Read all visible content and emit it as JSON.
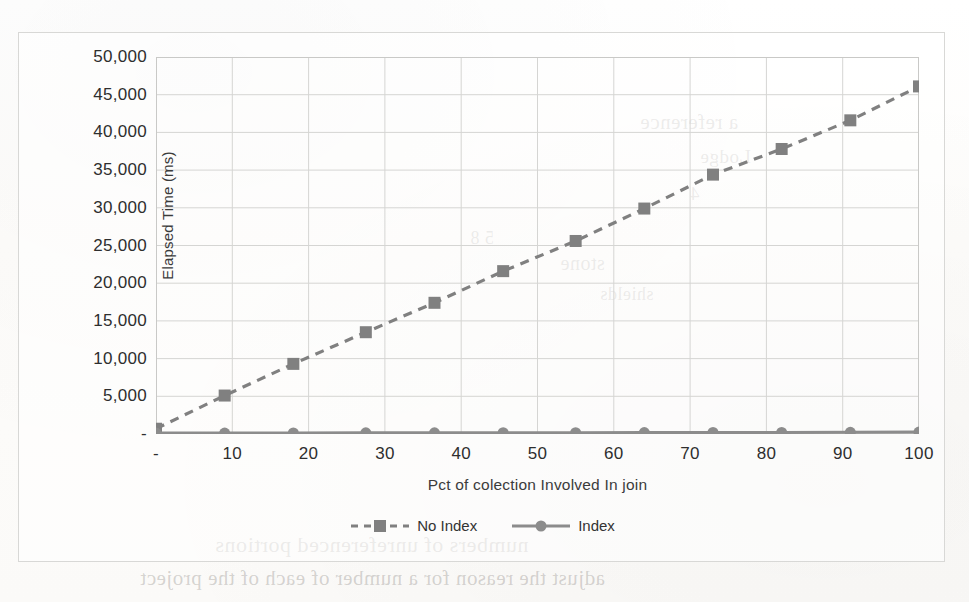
{
  "chart_data": {
    "type": "line",
    "title": "",
    "xlabel": "Pct of colection Involved In join",
    "ylabel": "Elapsed Time (ms)",
    "x": [
      0,
      9,
      18,
      27.5,
      36.5,
      45.5,
      55,
      64,
      73,
      82,
      91,
      100
    ],
    "xlim": [
      0,
      100
    ],
    "ylim": [
      0,
      50000
    ],
    "grid": true,
    "legend_position": "bottom",
    "x_tick_labels": [
      "-",
      "10",
      "20",
      "30",
      "40",
      "50",
      "60",
      "70",
      "80",
      "90",
      "100"
    ],
    "x_tick_values": [
      0,
      10,
      20,
      30,
      40,
      50,
      60,
      70,
      80,
      90,
      100
    ],
    "y_tick_labels": [
      "-",
      "5,000",
      "10,000",
      "15,000",
      "20,000",
      "25,000",
      "30,000",
      "35,000",
      "40,000",
      "45,000",
      "50,000"
    ],
    "y_tick_values": [
      0,
      5000,
      10000,
      15000,
      20000,
      25000,
      30000,
      35000,
      40000,
      45000,
      50000
    ],
    "series": [
      {
        "name": "No Index",
        "values": [
          700,
          5100,
          9300,
          13500,
          17400,
          21600,
          25600,
          29900,
          34400,
          37800,
          41600,
          46100
        ],
        "color": "#808080",
        "linestyle": "dashed",
        "marker": "square"
      },
      {
        "name": "Index",
        "values": [
          120,
          130,
          140,
          150,
          160,
          170,
          180,
          190,
          200,
          215,
          230,
          250
        ],
        "color": "#8c8c8c",
        "linestyle": "solid",
        "marker": "circle"
      }
    ]
  },
  "legend": {
    "items": [
      {
        "label": "No Index"
      },
      {
        "label": "Index"
      }
    ]
  },
  "page_bleed": {
    "lines": [
      {
        "text": "a reference",
        "x": 640,
        "y": 110,
        "size": 21
      },
      {
        "text": "Lodge",
        "x": 700,
        "y": 146,
        "size": 19
      },
      {
        "text": "4",
        "x": 690,
        "y": 184,
        "size": 18
      },
      {
        "text": "5 8",
        "x": 470,
        "y": 228,
        "size": 18
      },
      {
        "text": "stone",
        "x": 560,
        "y": 252,
        "size": 20
      },
      {
        "text": "shields",
        "x": 600,
        "y": 284,
        "size": 18
      },
      {
        "text": "numbers of unreferenced portions",
        "x": 215,
        "y": 532,
        "size": 22
      },
      {
        "text": "adjust the reason for a number of each of the project",
        "x": 140,
        "y": 566,
        "size": 21
      }
    ]
  }
}
